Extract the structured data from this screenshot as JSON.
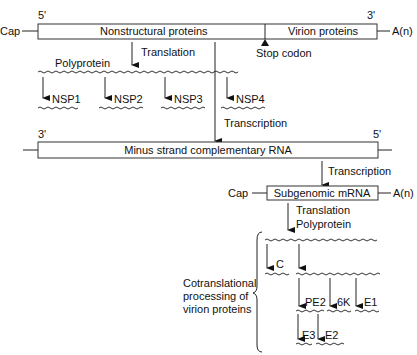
{
  "genome": {
    "cap": "Cap",
    "five_prime": "5'",
    "three_prime": "3'",
    "poly_a": "A(n)",
    "nonstructural": "Nonstructural proteins",
    "virion": "Virion proteins",
    "stop_codon": "Stop codon"
  },
  "nonstructural_pathway": {
    "translation": "Translation",
    "polyprotein": "Polyprotein",
    "products": [
      "NSP1",
      "NSP2",
      "NSP3",
      "NSP4"
    ]
  },
  "transcription_1": "Transcription",
  "minus_strand": {
    "three_prime": "3'",
    "five_prime": "5'",
    "label": "Minus strand complementary RNA"
  },
  "transcription_2": "Transcription",
  "subgenomic": {
    "cap": "Cap",
    "label": "Subgenomic mRNA",
    "poly_a": "A(n)",
    "translation": "Translation",
    "polyprotein": "Polyprotein"
  },
  "virion_processing": {
    "bracket_label": [
      "Cotranslational",
      "processing of",
      "virion proteins"
    ],
    "products_level1": [
      "C"
    ],
    "products_level2": [
      "PE2",
      "6K",
      "E1"
    ],
    "products_level3": [
      "E3",
      "E2"
    ]
  }
}
